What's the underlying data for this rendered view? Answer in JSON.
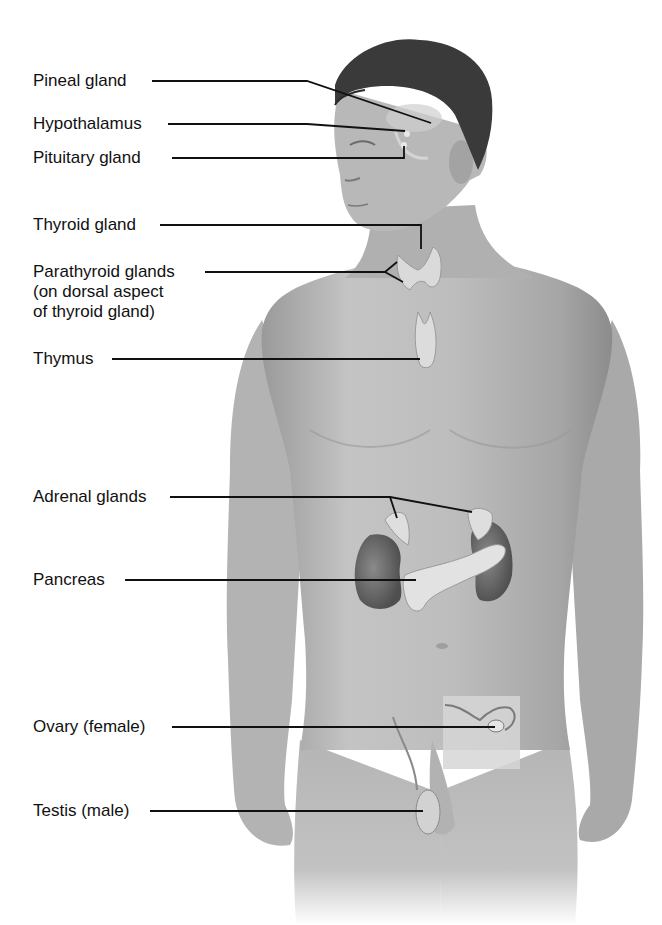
{
  "figure": {
    "title_partial": "",
    "labels": [
      {
        "id": "pineal",
        "text": "Pineal gland"
      },
      {
        "id": "hypothalamus",
        "text": "Hypothalamus"
      },
      {
        "id": "pituitary",
        "text": "Pituitary gland"
      },
      {
        "id": "thyroid",
        "text": "Thyroid gland"
      },
      {
        "id": "parathyroid",
        "text": "Parathyroid glands",
        "line2": "(on dorsal aspect",
        "line3": "of thyroid gland)"
      },
      {
        "id": "thymus",
        "text": "Thymus"
      },
      {
        "id": "adrenal",
        "text": "Adrenal glands"
      },
      {
        "id": "pancreas",
        "text": "Pancreas"
      },
      {
        "id": "ovary",
        "text": "Ovary (female)"
      },
      {
        "id": "testis",
        "text": "Testis (male)"
      }
    ],
    "colors": {
      "background": "#ffffff",
      "skin": "#b9b9b9",
      "skin_shadow": "#8e8e8e",
      "hair": "#3a3a3a",
      "organ": "#d8d8d8",
      "kidney": "#6e6e6e",
      "leader_line": "#111111",
      "inset_box": "#d4d4d4"
    }
  }
}
